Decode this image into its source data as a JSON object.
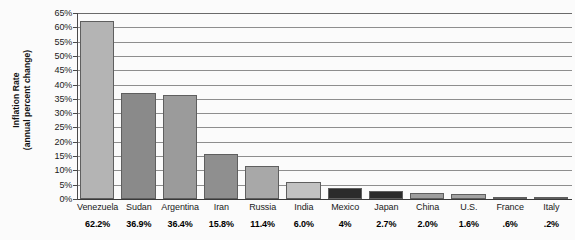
{
  "chart_data": {
    "type": "bar",
    "title": "",
    "subtitle": "",
    "xlabel": "",
    "ylabel_line1": "Inflation Rate",
    "ylabel_line2": "(annual percent change)",
    "ylim": [
      0,
      65
    ],
    "ytick_step": 5,
    "ytick_labels": [
      "65%",
      "60%",
      "55%",
      "50%",
      "45%",
      "40%",
      "35%",
      "30%",
      "25%",
      "20%",
      "15%",
      "10%",
      "5%",
      "0%"
    ],
    "ytick_values": [
      65,
      60,
      55,
      50,
      45,
      40,
      35,
      30,
      25,
      20,
      15,
      10,
      5,
      0
    ],
    "grid": true,
    "grid_axis": "y",
    "legend": false,
    "legend_position": "none",
    "categories": [
      "Venezuela",
      "Sudan",
      "Argentina",
      "Iran",
      "Russia",
      "India",
      "Mexico",
      "Japan",
      "China",
      "U.S.",
      "France",
      "Italy"
    ],
    "values": [
      62.2,
      36.9,
      36.4,
      15.8,
      11.4,
      6.0,
      4.0,
      2.7,
      2.0,
      1.6,
      0.6,
      0.2
    ],
    "value_labels": [
      "62.2%",
      "36.9%",
      "36.4%",
      "15.8%",
      "11.4%",
      "6.0%",
      "4%",
      "2.7%",
      "2.0%",
      "1.6%",
      ".6%",
      ".2%"
    ],
    "bar_colors": [
      "#b4b4b4",
      "#8a8a8a",
      "#9b9b9b",
      "#8f8f8f",
      "#a8a8a8",
      "#c2c2c2",
      "#2b2b2b",
      "#2b2b2b",
      "#9e9e9e",
      "#a3a3a3",
      "#c9c9c9",
      "#cfcfcf"
    ],
    "bars": [
      {
        "category": "Venezuela",
        "value": 62.2,
        "value_label": "62.2%",
        "color": "#b4b4b4"
      },
      {
        "category": "Sudan",
        "value": 36.9,
        "value_label": "36.9%",
        "color": "#8a8a8a"
      },
      {
        "category": "Argentina",
        "value": 36.4,
        "value_label": "36.4%",
        "color": "#9b9b9b"
      },
      {
        "category": "Iran",
        "value": 15.8,
        "value_label": "15.8%",
        "color": "#8f8f8f"
      },
      {
        "category": "Russia",
        "value": 11.4,
        "value_label": "11.4%",
        "color": "#a8a8a8"
      },
      {
        "category": "India",
        "value": 6.0,
        "value_label": "6.0%",
        "color": "#c2c2c2"
      },
      {
        "category": "Mexico",
        "value": 4.0,
        "value_label": "4%",
        "color": "#2b2b2b"
      },
      {
        "category": "Japan",
        "value": 2.7,
        "value_label": "2.7%",
        "color": "#2b2b2b"
      },
      {
        "category": "China",
        "value": 2.0,
        "value_label": "2.0%",
        "color": "#9e9e9e"
      },
      {
        "category": "U.S.",
        "value": 1.6,
        "value_label": "1.6%",
        "color": "#a3a3a3"
      },
      {
        "category": "France",
        "value": 0.6,
        "value_label": ".6%",
        "color": "#c9c9c9"
      },
      {
        "category": "Italy",
        "value": 0.2,
        "value_label": ".2%",
        "color": "#cfcfcf"
      }
    ]
  },
  "colors": {
    "background": "#fbfbfb",
    "gridline": "#8e8e8e",
    "axis": "#4a4a4a",
    "bar_border": "#5f5f5f",
    "text": "#1a1a1a"
  }
}
